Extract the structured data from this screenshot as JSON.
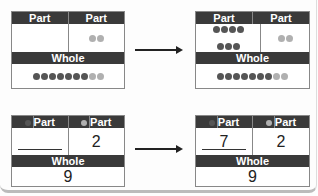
{
  "labels": {
    "part": "Part",
    "whole": "Whole"
  },
  "top_left": {
    "part1_dots": 0,
    "part2_dots": 2,
    "whole_dark": 7,
    "whole_light": 2
  },
  "top_right": {
    "part1_dots": 7,
    "part2_dots": 2,
    "whole_dark": 7,
    "whole_light": 2
  },
  "bottom_left": {
    "part1": "",
    "part2": "2",
    "whole": "9"
  },
  "bottom_right": {
    "part1": "7",
    "part2": "2",
    "whole": "9"
  },
  "colors": {
    "header": "#3a3a3a",
    "dark_dot": "#555555",
    "light_dot": "#b0b0b0"
  }
}
